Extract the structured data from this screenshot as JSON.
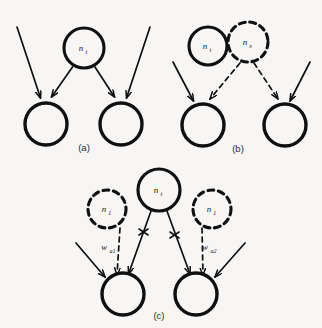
{
  "figure": {
    "background_color": "#f7f6f4",
    "stroke_color": "#101010",
    "panels": [
      {
        "id": "a",
        "caption": "(a)",
        "nodes": [
          {
            "id": "a-top",
            "label_base": "n",
            "label_sub": "t",
            "style": "solid"
          },
          {
            "id": "a-left",
            "label_base": "",
            "label_sub": "",
            "style": "solid"
          },
          {
            "id": "a-right",
            "label_base": "",
            "label_sub": "",
            "style": "solid"
          }
        ],
        "edges": [
          {
            "from": "external",
            "to": "a-left",
            "style": "solid"
          },
          {
            "from": "a-top",
            "to": "a-left",
            "style": "solid"
          },
          {
            "from": "a-top",
            "to": "a-right",
            "style": "solid"
          },
          {
            "from": "external",
            "to": "a-right",
            "style": "solid"
          }
        ]
      },
      {
        "id": "b",
        "caption": "(b)",
        "nodes": [
          {
            "id": "b-top-left",
            "label_base": "n",
            "label_sub": "t",
            "style": "solid"
          },
          {
            "id": "b-top-right",
            "label_base": "n",
            "label_sub": "s",
            "style": "dashed"
          },
          {
            "id": "b-left",
            "label_base": "",
            "label_sub": "",
            "style": "solid"
          },
          {
            "id": "b-right",
            "label_base": "",
            "label_sub": "",
            "style": "solid"
          }
        ],
        "edges": [
          {
            "from": "external",
            "to": "b-left",
            "style": "solid"
          },
          {
            "from": "b-top-right",
            "to": "b-left",
            "style": "dashed"
          },
          {
            "from": "b-top-right",
            "to": "b-right",
            "style": "dashed"
          },
          {
            "from": "external",
            "to": "b-right",
            "style": "solid"
          }
        ]
      },
      {
        "id": "c",
        "caption": "(c)",
        "nodes": [
          {
            "id": "c-top",
            "label_base": "n",
            "label_sub": "t",
            "style": "solid"
          },
          {
            "id": "c-dash-left",
            "label_base": "n",
            "label_sub": "1",
            "style": "dashed"
          },
          {
            "id": "c-dash-right",
            "label_base": "n",
            "label_sub": "1",
            "style": "dashed"
          },
          {
            "id": "c-left",
            "label_base": "",
            "label_sub": "",
            "style": "solid"
          },
          {
            "id": "c-right",
            "label_base": "",
            "label_sub": "",
            "style": "solid"
          }
        ],
        "edges": [
          {
            "from": "external",
            "to": "c-left",
            "style": "solid"
          },
          {
            "from": "c-dash-left",
            "to": "c-left",
            "style": "dashed",
            "weight_base": "w",
            "weight_sub": "a1"
          },
          {
            "from": "c-top",
            "to": "c-left",
            "style": "solid",
            "crossed": true
          },
          {
            "from": "c-top",
            "to": "c-right",
            "style": "solid",
            "crossed": true
          },
          {
            "from": "c-dash-right",
            "to": "c-right",
            "style": "dashed",
            "weight_base": "w",
            "weight_sub": "a2"
          },
          {
            "from": "external",
            "to": "c-right",
            "style": "solid"
          }
        ],
        "weights": [
          {
            "id": "w-a1",
            "base": "w",
            "sub": "a1"
          },
          {
            "id": "w-a2",
            "base": "w",
            "sub": "a2"
          }
        ]
      }
    ]
  }
}
